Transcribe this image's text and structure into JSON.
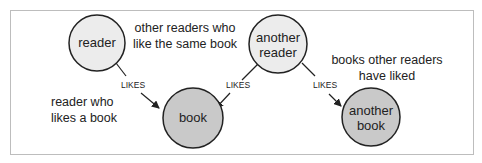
{
  "diagram": {
    "nodes": [
      {
        "id": "reader",
        "label_lines": [
          "reader"
        ],
        "fill": "#ececec"
      },
      {
        "id": "book",
        "label_lines": [
          "book"
        ],
        "fill": "#c9c9c9"
      },
      {
        "id": "another_reader",
        "label_lines": [
          "another",
          "reader"
        ],
        "fill": "#ececec"
      },
      {
        "id": "another_book",
        "label_lines": [
          "another",
          "book"
        ],
        "fill": "#c9c9c9"
      }
    ],
    "edges": [
      {
        "from": "reader",
        "to": "book",
        "label": "LIKES"
      },
      {
        "from": "another_reader",
        "to": "book",
        "label": "LIKES"
      },
      {
        "from": "another_reader",
        "to": "another_book",
        "label": "LIKES"
      }
    ],
    "annotations": {
      "reader_who_likes": [
        "reader who",
        "likes a book"
      ],
      "other_readers": [
        "other readers who",
        "like the same book"
      ],
      "books_other_readers": [
        "books other readers",
        "have liked"
      ]
    }
  }
}
